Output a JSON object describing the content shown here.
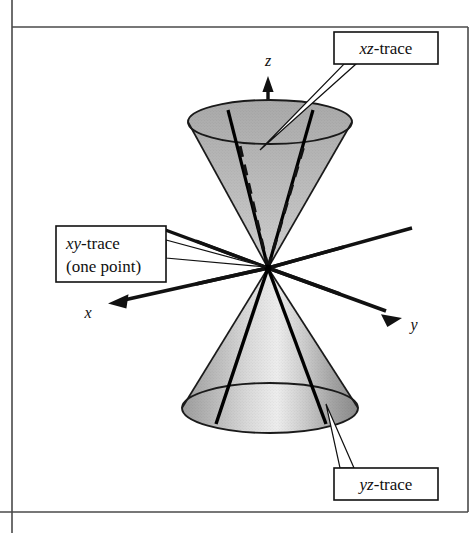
{
  "figure": {
    "background_color": "#ffffff",
    "frame": {
      "border_color": "#3a3a3a",
      "left_rule_x": 12,
      "top_y": 27,
      "right_x": 468,
      "bottom_y": 512
    }
  },
  "axes": {
    "x": {
      "label": "x",
      "label_x": 88,
      "label_y": 318,
      "arrow_tip": [
        110,
        303
      ],
      "origin": [
        268,
        268
      ]
    },
    "y": {
      "label": "y",
      "label_x": 414,
      "label_y": 330,
      "arrow_tip": [
        400,
        320
      ],
      "origin": [
        268,
        268
      ]
    },
    "z": {
      "label": "z",
      "label_x": 268,
      "label_y": 66,
      "arrow_tip": [
        268,
        78
      ],
      "origin": [
        268,
        268
      ]
    }
  },
  "callouts": [
    {
      "name": "xz-trace",
      "italic_part": "xz",
      "roman_part": "-trace",
      "box": {
        "x": 334,
        "y": 32,
        "width": 104,
        "height": 32
      },
      "leader_to": [
        258,
        150
      ]
    },
    {
      "name": "xy-trace",
      "italic_part": "xy",
      "roman_part": "-trace",
      "line2": "(one point)",
      "box": {
        "x": 56,
        "y": 226,
        "width": 110,
        "height": 56
      },
      "leader_to": [
        268,
        268
      ]
    },
    {
      "name": "yz-trace",
      "italic_part": "yz",
      "roman_part": "-trace",
      "box": {
        "x": 334,
        "y": 468,
        "width": 104,
        "height": 32
      },
      "leader_to": [
        330,
        405
      ]
    }
  ],
  "cones": {
    "fill_light": "#e8e8e8",
    "fill_mid": "#b8b8b8",
    "fill_dark": "#8e8e8e",
    "outline_color": "#1a1a1a",
    "upper": {
      "apex": [
        268,
        268
      ],
      "rim_center": [
        270,
        122
      ],
      "rim_rx": 82,
      "rim_ry": 22
    },
    "lower": {
      "apex": [
        268,
        268
      ],
      "rim_center": [
        270,
        408
      ],
      "rim_rx": 88,
      "rim_ry": 25
    }
  },
  "traces": {
    "xz_trace_color": "#000000",
    "yz_trace_color": "#000000",
    "xy_trace_note": "(one point)",
    "hidden_line_style": "dashed"
  }
}
